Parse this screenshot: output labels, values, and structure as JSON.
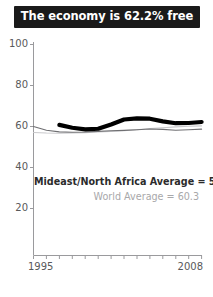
{
  "title": "The economy is 62.2% free",
  "colors": {
    "banner_background": "#1a1a1a",
    "banner_text": "#ffffff",
    "country_line": "#000000",
    "region_line": "#6f6f72",
    "world_line": "#c8c8cb",
    "axis": "#9a9a9d",
    "tick_label": "#59595b",
    "region_label": "#2b2b2b",
    "world_label": "#a8a8aa"
  },
  "annotations": {
    "region_average_label": "Mideast/North Africa Average = 58.7",
    "world_average_label": "World Average = 60.3"
  },
  "axes": {
    "y_ticks": [
      "100",
      "80",
      "60",
      "40",
      "20"
    ],
    "x_start": "1995",
    "x_end": "2008"
  },
  "chart_data": {
    "type": "line",
    "title": "The economy is 62.2% free",
    "xlabel": "",
    "ylabel": "",
    "xlim": [
      1995,
      2008
    ],
    "ylim": [
      10,
      100
    ],
    "y_ticks": [
      20,
      40,
      60,
      80,
      100
    ],
    "x_ticks": [
      1995,
      1996,
      1997,
      1998,
      1999,
      2000,
      2001,
      2002,
      2003,
      2004,
      2005,
      2006,
      2007,
      2008
    ],
    "x_tick_labels_shown": [
      1995,
      2008
    ],
    "grid": false,
    "legend": "inline-annotation",
    "x": [
      1995,
      1996,
      1997,
      1998,
      1999,
      2000,
      2001,
      2002,
      2003,
      2004,
      2005,
      2006,
      2007,
      2008
    ],
    "series": [
      {
        "name": "Country score",
        "style": "thick-black",
        "color": "#000000",
        "width": 4.2,
        "x": [
          1997,
          1998,
          1999,
          2000,
          2001,
          2002,
          2003,
          2004,
          2005,
          2006,
          2007,
          2008
        ],
        "values": [
          60.8,
          59.4,
          58.6,
          58.9,
          61.0,
          63.4,
          64.0,
          63.8,
          62.5,
          61.6,
          61.7,
          62.2
        ]
      },
      {
        "name": "Mideast/North Africa Average",
        "style": "thin-dark",
        "color": "#6f6f72",
        "width": 1.1,
        "x": [
          1995,
          1996,
          1997,
          1998,
          1999,
          2000,
          2001,
          2002,
          2003,
          2004,
          2005,
          2006,
          2007,
          2008
        ],
        "values": [
          60.0,
          58.2,
          57.4,
          57.2,
          57.3,
          57.6,
          57.9,
          58.1,
          58.4,
          58.8,
          58.6,
          58.2,
          58.4,
          58.7
        ]
      },
      {
        "name": "World Average",
        "style": "thin-light",
        "color": "#c8c8cb",
        "width": 1.1,
        "x": [
          1995,
          1996,
          1997,
          1998,
          1999,
          2000,
          2001,
          2002,
          2003,
          2004,
          2005,
          2006,
          2007,
          2008
        ],
        "values": [
          57.1,
          56.8,
          56.7,
          56.8,
          57.0,
          57.3,
          57.6,
          58.0,
          58.4,
          59.0,
          59.4,
          59.8,
          60.1,
          60.3
        ]
      }
    ],
    "annotations": [
      "Mideast/North Africa Average = 58.7",
      "World Average = 60.3"
    ]
  }
}
